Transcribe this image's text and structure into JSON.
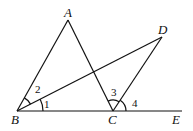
{
  "diagram": {
    "points": {
      "A": {
        "label": "A",
        "x": 68,
        "y": 20
      },
      "B": {
        "label": "B",
        "x": 17,
        "y": 111
      },
      "C": {
        "label": "C",
        "x": 113,
        "y": 111
      },
      "D": {
        "label": "D",
        "x": 162,
        "y": 37
      },
      "E": {
        "label": "E",
        "x": 182,
        "y": 111
      }
    },
    "segments": [
      [
        "B",
        "A"
      ],
      [
        "A",
        "C"
      ],
      [
        "B",
        "D"
      ],
      [
        "C",
        "D"
      ],
      [
        "B",
        "E"
      ]
    ],
    "angles": [
      {
        "label": "1",
        "vertex": "B"
      },
      {
        "label": "2",
        "vertex": "B"
      },
      {
        "label": "3",
        "vertex": "C"
      },
      {
        "label": "4",
        "vertex": "C"
      }
    ]
  }
}
